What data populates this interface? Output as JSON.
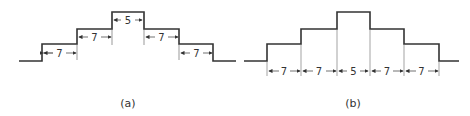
{
  "figures": [
    {
      "caption": "(a)",
      "dimensions": [
        "7",
        "7",
        "5",
        "7",
        "7"
      ],
      "description": "Stepped profile with dimensions shown inside each step"
    },
    {
      "caption": "(b)",
      "dimensions": [
        "7",
        "7",
        "5",
        "7",
        "7"
      ],
      "description": "Stepped profile with chained dimensions below baseline"
    }
  ],
  "colors": {
    "line": "#333333",
    "thin": "#666666"
  }
}
